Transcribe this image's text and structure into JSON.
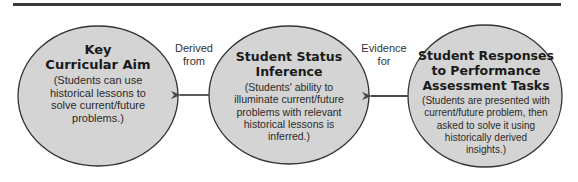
{
  "colors": {
    "circle_fill": "#d4d4d4",
    "circle_stroke": "#333333",
    "arrow": "#4a4a4a",
    "top_rule": "#3a3a3a"
  },
  "nodes": [
    {
      "title_lines": [
        "Key",
        "Curricular Aim"
      ],
      "desc_lines": [
        "(Students can use",
        "historical lessons to",
        "solve current/future",
        "problems.)"
      ]
    },
    {
      "title_lines": [
        "Student Status",
        "Inference"
      ],
      "desc_lines": [
        "(Students' ability to",
        "illuminate current/future",
        "problems with relevant",
        "historical lessons is",
        "inferred.)"
      ]
    },
    {
      "title_lines": [
        "Student Responses",
        "to Performance",
        "Assessment Tasks"
      ],
      "desc_lines": [
        "(Students are presented with",
        "current/future problem, then",
        "asked to solve it using",
        "historically derived",
        "insights.)"
      ]
    }
  ],
  "edges": [
    {
      "from": 1,
      "to": 0,
      "label_lines": [
        "Derived",
        "from"
      ]
    },
    {
      "from": 2,
      "to": 1,
      "label_lines": [
        "Evidence",
        "for"
      ]
    }
  ]
}
